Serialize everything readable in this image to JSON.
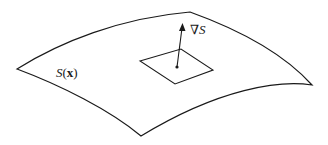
{
  "diagram": {
    "surface_label": {
      "func": "S",
      "open": "(",
      "arg": "x",
      "close": ")"
    },
    "gradient_label": {
      "symbol": "∇",
      "var": "S"
    },
    "colors": {
      "stroke": "#1a1a1a",
      "background": "#ffffff"
    }
  }
}
